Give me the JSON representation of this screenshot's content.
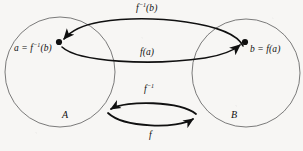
{
  "figure": {
    "background_color": "#f7f6f4",
    "ink_color": "#101010",
    "sets": {
      "left": {
        "label": "A",
        "center_x": 60,
        "center_y": 72,
        "radius": 55
      },
      "right": {
        "label": "B",
        "center_x": 246,
        "center_y": 73,
        "radius": 54
      }
    },
    "points": {
      "a": {
        "label_text": "a = f⁻¹(b)",
        "x": 59,
        "y": 42
      },
      "b": {
        "label_text": "b = f(a)",
        "x": 245,
        "y": 42
      }
    },
    "arrows": {
      "top": {
        "label": "f⁻¹(b)",
        "from": "b",
        "to": "a",
        "direction": "right-to-left"
      },
      "middle": {
        "label": "f(a)",
        "from": "a",
        "to": "b",
        "direction": "left-to-right"
      },
      "lens_upper": {
        "label": "f⁻¹",
        "from": "B",
        "to": "A",
        "direction": "right-to-left"
      },
      "lens_lower": {
        "label": "f",
        "from": "A",
        "to": "B",
        "direction": "left-to-right"
      }
    },
    "label_parts": {
      "a_lead": "a = f",
      "a_exp": "−1",
      "a_tail": "(b)",
      "b_full": "b = f(a)",
      "finv_b_lead": "f",
      "finv_b_exp": "−1",
      "finv_b_tail": "(b)",
      "f_a": "f(a)",
      "finv_lead": "f",
      "finv_exp": "−1",
      "f_only": "f",
      "set_a": "A",
      "set_b": "B"
    }
  }
}
